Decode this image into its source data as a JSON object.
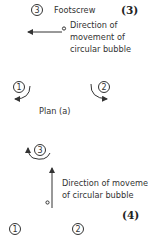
{
  "top": {
    "footscrew_number": "3",
    "footscrew_label": "Footscrew",
    "figure_label": "(3)"
  },
  "plan_a": {
    "direction_lines": [
      "Direction of",
      "movement of",
      "circular bubble"
    ],
    "screw_left_number": "1",
    "screw_right_number": "2",
    "caption": "Plan (a)"
  },
  "plan_b": {
    "screw_top_number": "3",
    "direction_lines": [
      "Direction of movement",
      "of circular bubble"
    ],
    "figure_label": "(4)",
    "screw_left_number": "1",
    "screw_right_number": "2"
  },
  "colors": {
    "ink": "#333333",
    "background": "#ffffff"
  }
}
